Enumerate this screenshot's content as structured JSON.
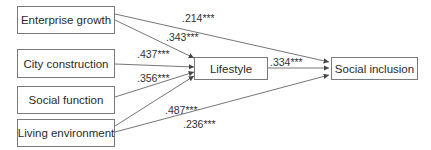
{
  "diagram": {
    "type": "path-model",
    "nodes": {
      "enterprise_growth": "Enterprise growth",
      "city_construction": "City construction",
      "social_function": "Social function",
      "living_environment": "Living environment",
      "lifestyle": "Lifestyle",
      "social_inclusion": "Social inclusion"
    },
    "edges": {
      "enterprise_to_inclusion": ".214***",
      "enterprise_to_lifestyle": ".343***",
      "city_to_lifestyle": ".437***",
      "social_to_lifestyle": ".356***",
      "living_to_lifestyle": ".487***",
      "living_to_inclusion": ".236***",
      "lifestyle_to_inclusion": ".334***"
    },
    "line_color": "#555555"
  }
}
